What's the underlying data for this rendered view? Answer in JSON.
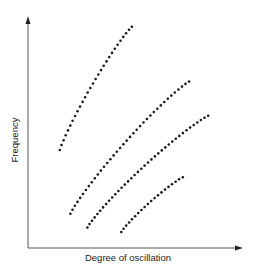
{
  "chart_data": {
    "type": "scatter",
    "title": "",
    "xlabel": "Degree of oscillation",
    "ylabel": "Frequency",
    "grid": false,
    "legend": null,
    "axes": {
      "ticks": false,
      "arrows": true
    },
    "xlim": [
      0,
      100
    ],
    "ylim": [
      0,
      100
    ],
    "series": [
      {
        "name": "curve-1",
        "start": [
          15,
          43
        ],
        "end": [
          49,
          97
        ],
        "points": 29,
        "shape": "concave-down"
      },
      {
        "name": "curve-2",
        "start": [
          20,
          15
        ],
        "end": [
          76,
          73
        ],
        "points": 38,
        "shape": "concave-down"
      },
      {
        "name": "curve-3",
        "start": [
          28,
          9
        ],
        "end": [
          85,
          58
        ],
        "points": 38,
        "shape": "concave-down"
      },
      {
        "name": "curve-4",
        "start": [
          44,
          7
        ],
        "end": [
          73,
          31
        ],
        "points": 20,
        "shape": "concave-down"
      }
    ],
    "marker_color": "#1a1a1a",
    "axis_color": "#555555"
  },
  "labels": {
    "x": "Degree of oscillation",
    "y": "Frequency"
  }
}
